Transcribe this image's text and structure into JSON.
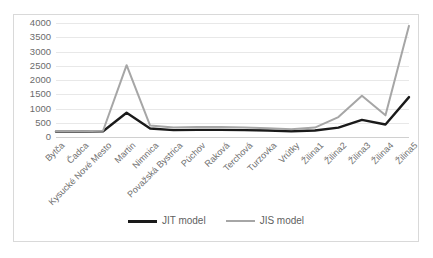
{
  "colors": {
    "jit": "#1a1a1a",
    "jis": "#a6a6a6",
    "grid": "#e8e8e8",
    "border": "#d9d9d9",
    "axis_text": "#6b6b6b"
  },
  "legend": {
    "position": "bottom",
    "entries": [
      {
        "label": "JIT model",
        "color_key": "jit",
        "icon": "line-swatch"
      },
      {
        "label": "JIS model",
        "color_key": "jis",
        "icon": "line-swatch"
      }
    ]
  },
  "y_axis": {
    "ticks": [
      "0",
      "500",
      "1000",
      "1500",
      "2000",
      "2500",
      "3000",
      "3500",
      "4000"
    ],
    "min": 0,
    "max": 4000,
    "step": 500
  },
  "chart_data": {
    "type": "line",
    "title": "",
    "subtitle": "",
    "xlabel": "",
    "ylabel": "",
    "ylim": [
      0,
      4000
    ],
    "ytick_step": 500,
    "grid": true,
    "legend_position": "bottom",
    "categories": [
      "Bytča",
      "Čadca",
      "Kysucké Nové Mesto",
      "Martin",
      "Nimnica",
      "Považská Bystrica",
      "Púchov",
      "Raková",
      "Terchová",
      "Turzovka",
      "Vrútky",
      "Žilina1",
      "Žilina2",
      "Žilina3",
      "Žilina4",
      "Žilina5"
    ],
    "series": [
      {
        "name": "JIT model",
        "color": "#1a1a1a",
        "values": [
          190,
          190,
          200,
          850,
          300,
          240,
          250,
          250,
          240,
          230,
          200,
          230,
          330,
          600,
          440,
          1400
        ]
      },
      {
        "name": "JIS model",
        "color": "#a6a6a6",
        "values": [
          200,
          200,
          220,
          2520,
          400,
          330,
          350,
          350,
          330,
          310,
          270,
          330,
          700,
          1450,
          760,
          3900
        ]
      }
    ]
  }
}
